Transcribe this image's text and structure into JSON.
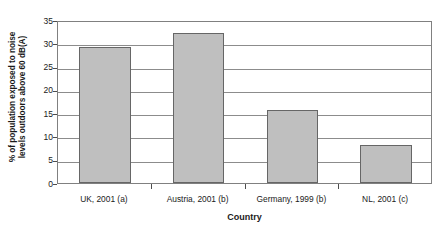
{
  "chart_data": {
    "type": "bar",
    "title": "",
    "categories": [
      "UK, 2001 (a)",
      "Austria, 2001 (b)",
      "Germany, 1999 (b)",
      "NL, 2001 (c)"
    ],
    "values": [
      29.1,
      32.3,
      15.7,
      8.2
    ],
    "series": [
      {
        "name": "% of population exposed to noise levels outdoors above 60 dB(A)",
        "values": [
          29.1,
          32.3,
          15.7,
          8.2
        ]
      }
    ],
    "xlabel": "Country",
    "ylabel": "% of population exposed to noise levels outdoors above 60 dB(A)",
    "ylabel_line1": "% of population exposed to noise",
    "ylabel_line2": "levels outdoors above 60 dB(A)",
    "ylim": [
      0,
      35
    ],
    "yticks": [
      0,
      5,
      10,
      15,
      20,
      25,
      30,
      35
    ],
    "ytick_labels": [
      "0",
      "5",
      "10",
      "15",
      "20",
      "25",
      "30",
      "35"
    ],
    "grid": "horizontal",
    "legend": "none",
    "bar_fill_color": "#bfbfbf",
    "bar_border_color": "#666666",
    "gridline_color": "#8c8c8c",
    "axis_color": "#808080"
  }
}
